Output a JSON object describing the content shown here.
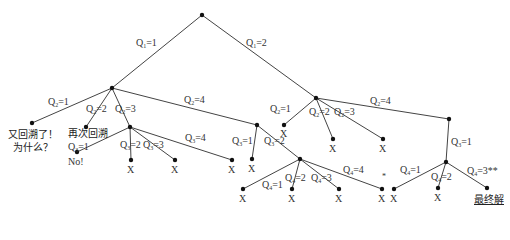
{
  "diagram": {
    "type": "backtracking-search-tree",
    "root": {
      "x": 202,
      "y": 15
    },
    "nodes": {
      "A": {
        "x": 112,
        "y": 88
      },
      "B": {
        "x": 316,
        "y": 98
      },
      "C": {
        "x": 32,
        "y": 123
      },
      "D": {
        "x": 86,
        "y": 127
      },
      "E": {
        "x": 130,
        "y": 127
      },
      "F": {
        "x": 257,
        "y": 125
      },
      "G": {
        "x": 77,
        "y": 152
      },
      "H": {
        "x": 131,
        "y": 160
      },
      "I": {
        "x": 175,
        "y": 160
      },
      "J": {
        "x": 232,
        "y": 160
      },
      "K": {
        "x": 252,
        "y": 159
      },
      "L": {
        "x": 300,
        "y": 159
      },
      "M": {
        "x": 333,
        "y": 139
      },
      "N": {
        "x": 383,
        "y": 139
      },
      "O": {
        "x": 449,
        "y": 145
      },
      "P": {
        "x": 243,
        "y": 189
      },
      "Q": {
        "x": 292,
        "y": 189
      },
      "R": {
        "x": 339,
        "y": 189
      },
      "S": {
        "x": 382,
        "y": 189
      },
      "T": {
        "x": 394,
        "y": 189
      },
      "U": {
        "x": 446,
        "y": 162
      },
      "V": {
        "x": 438,
        "y": 188
      },
      "W": {
        "x": 487,
        "y": 188
      }
    },
    "edges": [
      {
        "from": "root",
        "to": "A",
        "label": "Q1=1",
        "lx": 136,
        "ly": 41
      },
      {
        "from": "root",
        "to": "B",
        "label": "Q1=2",
        "lx": 246,
        "ly": 40
      },
      {
        "from": "A",
        "to": "C",
        "label": "Q2=1",
        "lx": 50,
        "ly": 98
      },
      {
        "from": "A",
        "to": "D",
        "label": "Q2=2",
        "lx": 86,
        "ly": 105
      },
      {
        "from": "A",
        "to": "E",
        "label": "Q2=3",
        "lx": 115,
        "ly": 105
      },
      {
        "from": "A",
        "to": "F",
        "label": "Q2=4",
        "lx": 185,
        "ly": 94
      },
      {
        "from": "E",
        "to": "G",
        "label": "Q3=1",
        "lx": 72,
        "ly": 143
      },
      {
        "from": "E",
        "to": "H",
        "label": "Q3=2",
        "lx": 121,
        "ly": 139
      },
      {
        "from": "E",
        "to": "I",
        "label": "Q3=3",
        "lx": 145,
        "ly": 139
      },
      {
        "from": "E",
        "to": "J",
        "label": "Q3=4",
        "lx": 185,
        "ly": 132
      },
      {
        "from": "F",
        "to": "K",
        "label": "Q3=1",
        "lx": 232,
        "ly": 135
      },
      {
        "from": "F",
        "to": "L",
        "label": "Q3=2",
        "lx": 265,
        "ly": 135
      },
      {
        "from": "B",
        "to": "M",
        "label": "Q2=1",
        "lx": 272,
        "ly": 104
      },
      {
        "from": "B",
        "to": "N",
        "label": "Q2=2",
        "lx": 310,
        "ly": 107
      },
      {
        "from": "B",
        "to": "N2",
        "label": "Q2=3",
        "lx": 335,
        "ly": 107
      },
      {
        "from": "B",
        "to": "O",
        "label": "Q2=4",
        "lx": 371,
        "ly": 96
      },
      {
        "from": "L",
        "to": "P",
        "label": "Q4=1",
        "lx": 262,
        "ly": 180
      },
      {
        "from": "L",
        "to": "Q",
        "label": "Q4=2",
        "lx": 287,
        "ly": 174
      },
      {
        "from": "L",
        "to": "R",
        "label": "Q4=3",
        "lx": 312,
        "ly": 174
      },
      {
        "from": "L",
        "to": "S",
        "label": "Q4=4",
        "lx": 345,
        "ly": 165
      },
      {
        "from": "O",
        "to": "U",
        "label": "Q3=1",
        "lx": 452,
        "ly": 138
      },
      {
        "from": "U",
        "to": "T",
        "label": "Q4=1",
        "lx": 400,
        "ly": 164
      },
      {
        "from": "U",
        "to": "V",
        "label": "Q4=2",
        "lx": 432,
        "ly": 172
      },
      {
        "from": "U",
        "to": "W",
        "label": "Q4=3**",
        "lx": 467,
        "ly": 166
      }
    ],
    "annotations": {
      "C": "又回溯了！\n为什么？",
      "D": "再次回溯",
      "G": "No!",
      "W": "最终解",
      "star": "*"
    },
    "x_marks": [
      "H",
      "I",
      "J",
      "K",
      "M",
      "N",
      "N2",
      "P",
      "Q",
      "R",
      "S",
      "T",
      "V"
    ]
  },
  "labels": {
    "q1_1": "Q1=1",
    "q1_2": "Q1=2",
    "backtrack_again": "又回溯了！",
    "why": "为什么？",
    "backtrack_twice": "再次回溯",
    "no": "No!",
    "x": "X",
    "star": "*",
    "final_solution": "最终解"
  }
}
